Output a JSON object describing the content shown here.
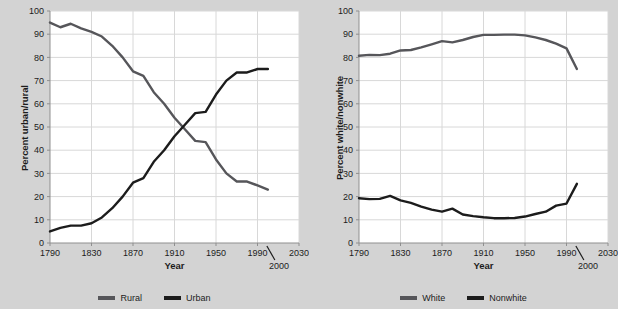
{
  "figure": {
    "background_color": "#d3d3d3",
    "plot_background_color": "#ffffff",
    "grid_color": "#d8d8d8",
    "axis_color": "#8f8f8f"
  },
  "chart_data": [
    {
      "type": "line",
      "panel": "left",
      "title": "",
      "xlabel": "Year",
      "ylabel": "Percent urban/rural",
      "xlim": [
        1790,
        2030
      ],
      "ylim": [
        0,
        100
      ],
      "xticks": [
        1790,
        1830,
        1870,
        1910,
        1950,
        1990,
        2030
      ],
      "yticks": [
        0,
        10,
        20,
        30,
        40,
        50,
        60,
        70,
        80,
        90,
        100
      ],
      "grid": true,
      "legend_position": "below",
      "annotations": [
        {
          "text": "2000",
          "x": 2000,
          "note": "callout with backslash leader pointing to year 2000 data endpoint"
        }
      ],
      "x": [
        1790,
        1800,
        1810,
        1820,
        1830,
        1840,
        1850,
        1860,
        1870,
        1880,
        1890,
        1900,
        1910,
        1920,
        1930,
        1940,
        1950,
        1960,
        1970,
        1980,
        1990,
        2000
      ],
      "series": [
        {
          "name": "Rural",
          "color": "#56565a",
          "values": [
            95,
            93,
            94.5,
            92.5,
            91,
            89,
            85,
            80,
            74,
            72,
            65,
            60,
            54,
            49,
            44,
            43.5,
            36,
            30,
            26.5,
            26.5,
            24.8,
            23,
            26
          ]
        },
        {
          "name": "Urban",
          "color": "#1c1c1c",
          "values": [
            5,
            6.5,
            7.5,
            7.5,
            8.5,
            11,
            15,
            20,
            26,
            28,
            35,
            40,
            46,
            51,
            56,
            56.5,
            64,
            70,
            73.5,
            73.5,
            75,
            75,
            75
          ]
        }
      ]
    },
    {
      "type": "line",
      "panel": "right",
      "title": "",
      "xlabel": "Year",
      "ylabel": "Percent white/nonwhite",
      "xlim": [
        1790,
        2030
      ],
      "ylim": [
        0,
        100
      ],
      "xticks": [
        1790,
        1830,
        1870,
        1910,
        1950,
        1990,
        2030
      ],
      "yticks": [
        0,
        10,
        20,
        30,
        40,
        50,
        60,
        70,
        80,
        90,
        100
      ],
      "grid": true,
      "legend_position": "below",
      "annotations": [
        {
          "text": "2000",
          "x": 2000,
          "note": "callout with backslash leader pointing to year 2000 data endpoint"
        }
      ],
      "x": [
        1790,
        1800,
        1810,
        1820,
        1830,
        1840,
        1850,
        1860,
        1870,
        1880,
        1890,
        1900,
        1910,
        1920,
        1930,
        1940,
        1950,
        1960,
        1970,
        1980,
        1990,
        2000
      ],
      "series": [
        {
          "name": "White",
          "color": "#56565a",
          "values": [
            80.7,
            81.1,
            81,
            81.6,
            83,
            83.2,
            84.3,
            85.6,
            87,
            86.5,
            87.5,
            88.8,
            89.7,
            89.7,
            89.8,
            89.8,
            89.5,
            88.6,
            87.5,
            85.9,
            83.9,
            75
          ]
        },
        {
          "name": "Nonwhite",
          "color": "#1c1c1c",
          "values": [
            19.3,
            18.9,
            19,
            20.3,
            18.4,
            17.3,
            15.7,
            14.4,
            13.5,
            14.8,
            12.3,
            11.6,
            11.1,
            10.7,
            10.7,
            10.8,
            11.4,
            12.5,
            13.5,
            16.1,
            17,
            25.5
          ]
        }
      ]
    }
  ],
  "panels": [
    {
      "id": "left",
      "ylabel": "Percent urban/rural",
      "xlabel": "Year",
      "xtick_labels": [
        "1790",
        "1830",
        "1870",
        "1910",
        "1950",
        "1990",
        "2030"
      ],
      "ytick_labels": [
        "0",
        "10",
        "20",
        "30",
        "40",
        "50",
        "60",
        "70",
        "80",
        "90",
        "100"
      ],
      "callout_label": "2000",
      "legend": [
        {
          "label": "Rural",
          "color": "#56565a"
        },
        {
          "label": "Urban",
          "color": "#1c1c1c"
        }
      ]
    },
    {
      "id": "right",
      "ylabel": "Percent white/nonwhite",
      "xlabel": "Year",
      "xtick_labels": [
        "1790",
        "1830",
        "1870",
        "1910",
        "1950",
        "1990",
        "2030"
      ],
      "ytick_labels": [
        "0",
        "10",
        "20",
        "30",
        "40",
        "50",
        "60",
        "70",
        "80",
        "90",
        "100"
      ],
      "callout_label": "2000",
      "legend": [
        {
          "label": "White",
          "color": "#56565a"
        },
        {
          "label": "Nonwhite",
          "color": "#1c1c1c"
        }
      ]
    }
  ]
}
